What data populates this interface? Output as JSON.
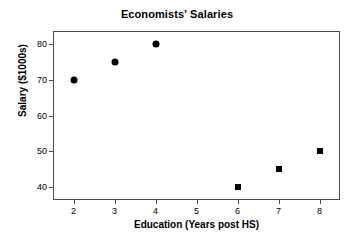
{
  "chart_data": {
    "type": "scatter",
    "title": "Economists' Salaries",
    "xlabel": "Education (Years post HS)",
    "ylabel": "Salary ($1000s)",
    "xlim": [
      1.5,
      8.5
    ],
    "ylim": [
      36.5,
      83.5
    ],
    "xticks": [
      "2",
      "3",
      "4",
      "5",
      "6",
      "7",
      "8"
    ],
    "yticks": [
      "40",
      "50",
      "60",
      "70",
      "80"
    ],
    "grid": false,
    "legend": null,
    "marker_color": "#000000",
    "frame_color": "#4d4d4d",
    "background": "#ffffff",
    "series": [
      {
        "name": "circle-group",
        "marker": "circle",
        "points": [
          {
            "x": 2,
            "y": 70
          },
          {
            "x": 3,
            "y": 75
          },
          {
            "x": 4,
            "y": 80
          }
        ]
      },
      {
        "name": "square-group",
        "marker": "square",
        "points": [
          {
            "x": 6,
            "y": 40
          },
          {
            "x": 7,
            "y": 45
          },
          {
            "x": 8,
            "y": 50
          }
        ]
      }
    ]
  }
}
